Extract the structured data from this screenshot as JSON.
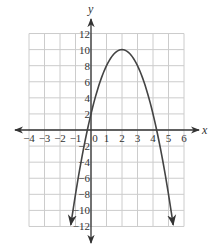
{
  "chart_data": {
    "type": "line",
    "title": "",
    "xlabel": "x",
    "ylabel": "y",
    "xlim": [
      -4,
      6
    ],
    "ylim": [
      -12,
      12
    ],
    "grid": true,
    "x_ticks": [
      -4,
      -3,
      -2,
      -1,
      0,
      1,
      2,
      3,
      4,
      5,
      6
    ],
    "x_tick_labels": [
      "−4",
      "−3",
      "−2",
      "−1",
      "0",
      "1",
      "2",
      "3",
      "4",
      "5",
      "6"
    ],
    "y_ticks": [
      -12,
      -10,
      -8,
      -6,
      -4,
      -2,
      2,
      4,
      6,
      8,
      10,
      12
    ],
    "y_tick_labels": [
      "−12",
      "−10",
      "−8",
      "−6",
      "−4",
      "−2",
      "2",
      "4",
      "6",
      "8",
      "10",
      "12"
    ],
    "series": [
      {
        "name": "parabola",
        "equation": "y = -2(x - 2)^2 + 10",
        "vertex": [
          2,
          10
        ],
        "y_intercept": 2,
        "x_intercepts": [
          -0.24,
          4.24
        ],
        "endpoints_with_arrows": [
          [
            -1.55,
            -11.8
          ],
          [
            5.55,
            -11.8
          ]
        ],
        "x": [
          -1.55,
          -1,
          -0.5,
          0,
          0.5,
          1,
          1.5,
          2,
          2.5,
          3,
          3.5,
          4,
          4.5,
          5,
          5.55
        ],
        "y": [
          -15.2,
          -8,
          -2.5,
          2,
          5.5,
          8,
          9.5,
          10,
          9.5,
          8,
          5.5,
          2,
          -2.5,
          -8,
          -15.2
        ]
      }
    ]
  },
  "colors": {
    "grid": "#cccccc",
    "axes": "#333333",
    "curve": "#444444"
  }
}
